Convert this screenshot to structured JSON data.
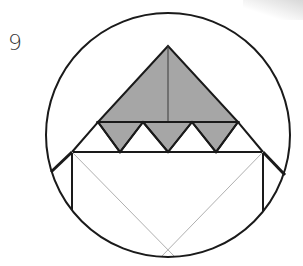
{
  "figure": {
    "number_label": "9",
    "colors": {
      "stroke": "#1a1a1a",
      "fill_gray": "#a6a6a6",
      "thin_line": "#b0b0b0",
      "background": "#ffffff"
    },
    "circle": {
      "cx": 168,
      "cy": 135,
      "r": 122
    },
    "large_triangle": {
      "apex": [
        168,
        46
      ],
      "base_left": [
        98,
        122
      ],
      "base_right": [
        238,
        122
      ]
    },
    "small_triangles": [
      {
        "top_left": [
          98,
          122
        ],
        "top_right": [
          143,
          122
        ],
        "bottom": [
          120,
          152
        ]
      },
      {
        "top_left": [
          143,
          122
        ],
        "top_right": [
          192,
          122
        ],
        "bottom": [
          168,
          152
        ]
      },
      {
        "top_left": [
          192,
          122
        ],
        "top_right": [
          238,
          122
        ],
        "bottom": [
          216,
          152
        ]
      }
    ],
    "rectangle": {
      "left": 72,
      "right": 263,
      "top": 152,
      "left_bottom": 210,
      "right_bottom": 212
    }
  }
}
